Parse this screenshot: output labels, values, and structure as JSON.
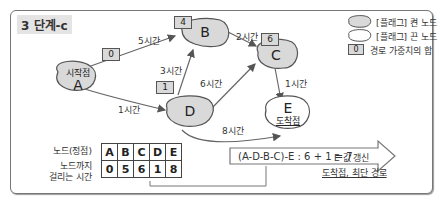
{
  "title": "3 단계-c",
  "nodes": {
    "A": {
      "letter": "A",
      "sub": "시작점",
      "weight": "0",
      "visited": true
    },
    "B": {
      "letter": "B",
      "weight": "4",
      "visited": true
    },
    "C": {
      "letter": "C",
      "weight": "6",
      "visited": true
    },
    "D": {
      "letter": "D",
      "weight": "1",
      "visited": true
    },
    "E": {
      "letter": "E",
      "sub": "도착점",
      "visited": false
    }
  },
  "edges": [
    {
      "from": "A",
      "to": "B",
      "label": "5시간"
    },
    {
      "from": "A",
      "to": "D",
      "label": "1시간"
    },
    {
      "from": "D",
      "to": "B",
      "label": "3시간"
    },
    {
      "from": "D",
      "to": "C",
      "label": "6시간"
    },
    {
      "from": "B",
      "to": "C",
      "label": "2시간"
    },
    {
      "from": "C",
      "to": "E",
      "label": "1시간"
    },
    {
      "from": "D",
      "to": "E",
      "label": "8시간"
    }
  ],
  "legend": {
    "visited": "[플래그] 켠 노드",
    "unvisited": "[플래그] 끈 노드",
    "weight_box": "0",
    "weight_label": "경로 가중치의 합"
  },
  "table": {
    "row1_label": "노드(정점)",
    "row2_label_line1": "노드까지",
    "row2_label_line2": "걸리는 시간",
    "headers": [
      "A",
      "B",
      "C",
      "D",
      "E"
    ],
    "values": [
      "0",
      "5",
      "6",
      "1",
      "8"
    ]
  },
  "calc": {
    "expression": "(A-D-B-C)-E : 6 + 1 = 7",
    "result_line1": "E 값 갱신",
    "result_line2": "도착점, 최단 경로"
  }
}
